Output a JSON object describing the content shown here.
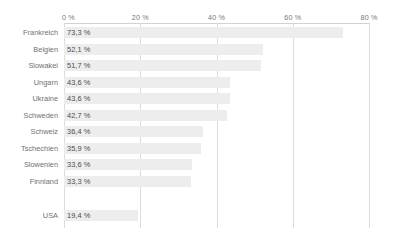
{
  "chart_data": {
    "type": "bar",
    "orientation": "horizontal",
    "title": "",
    "subtitle": "",
    "xlabel": "",
    "ylabel": "",
    "xlim": [
      0,
      86
    ],
    "grid": "vertical",
    "legend": "none",
    "axis_position": "top",
    "tick_labels": [
      "0 %",
      "20 %",
      "40 %",
      "60 %",
      "80 %"
    ],
    "tick_values": [
      0,
      20,
      40,
      60,
      80
    ],
    "value_label_format": "german-decimal-comma-percent",
    "bar_color": "#ededed",
    "gridline_color": "#dcdcdc",
    "axis_line_color": "#d2d2d2",
    "label_color": "#6f7072",
    "value_color": "#4a4b4d",
    "categories": [
      "Frankreich",
      "Belgien",
      "Slowakei",
      "Ungarn",
      "Ukraine",
      "Schweden",
      "Schweiz",
      "Tschechien",
      "Slowenien",
      "Finnland",
      "USA"
    ],
    "values": [
      73.3,
      52.1,
      51.7,
      43.6,
      43.6,
      42.7,
      36.4,
      35.9,
      33.6,
      33.3,
      19.4
    ],
    "value_labels": [
      "73,3 %",
      "52,1 %",
      "51,7 %",
      "43,6 %",
      "43,6 %",
      "42,7 %",
      "36,4 %",
      "35,9 %",
      "33,6 %",
      "33,3 %",
      "19,4 %"
    ],
    "groups": [
      {
        "name": "europe",
        "categories_count": 10
      },
      {
        "name": "usa",
        "categories_count": 1,
        "separated": true
      }
    ]
  }
}
